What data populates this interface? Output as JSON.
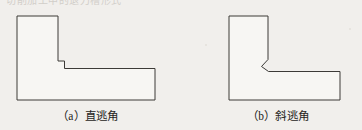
{
  "page": {
    "background_color": "#f1efec",
    "width": 362,
    "height": 130
  },
  "header": {
    "clipped_text": "切削加工中的退刀槽形式"
  },
  "figures": [
    {
      "id": "figure-a",
      "caption": "（a）直逃角",
      "label": "a",
      "name": "直逃角",
      "corner_relief": "square",
      "stroke_color": "#3c3a37",
      "fill_color": "#f7f6f3",
      "stroke_width": 1
    },
    {
      "id": "figure-b",
      "caption": "（b）斜逃角",
      "label": "b",
      "name": "斜逃角",
      "corner_relief": "chamfer",
      "stroke_color": "#3c3a37",
      "fill_color": "#f7f6f3",
      "stroke_width": 1
    }
  ],
  "geometry": {
    "figure_a_outline": "M17,16 L58,16 L58,62 L65,62 L65,69 L155,69 L155,100 L17,100 Z",
    "figure_b_outline": "M229,16 L268,16 L268,60 L262,67 L269,72 L340,72 L340,100 L229,100 L229,16 Z"
  }
}
